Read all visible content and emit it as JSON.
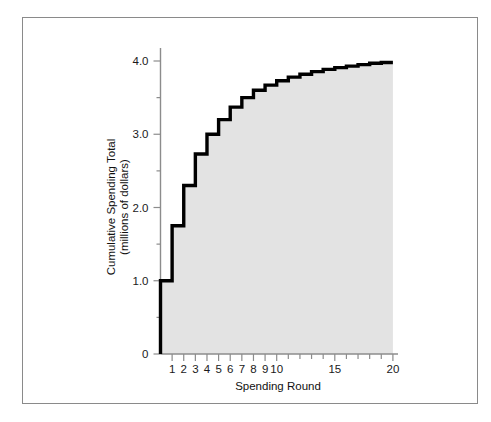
{
  "figure": {
    "background_color": "#ffffff",
    "frame_color": "#8a8a8a",
    "fill_color": "#e3e3e3",
    "line_color": "#000000"
  },
  "chart_data": {
    "type": "area",
    "title": "",
    "subtitle": "",
    "xlabel": "Spending Round",
    "ylabel": "Cumulative Spending Total\n(millions of dollars)",
    "ylabel_line1": "Cumulative Spending Total",
    "ylabel_line2": "(millions of dollars)",
    "x": [
      1,
      2,
      3,
      4,
      5,
      6,
      7,
      8,
      9,
      10,
      11,
      12,
      13,
      14,
      15,
      16,
      17,
      18,
      19,
      20
    ],
    "values": [
      1.0,
      1.75,
      2.3,
      2.73,
      3.0,
      3.2,
      3.37,
      3.5,
      3.6,
      3.67,
      3.73,
      3.78,
      3.82,
      3.855,
      3.885,
      3.91,
      3.93,
      3.95,
      3.97,
      3.98
    ],
    "series": [
      {
        "name": "Cumulative Spending Total",
        "values": [
          1.0,
          1.75,
          2.3,
          2.73,
          3.0,
          3.2,
          3.37,
          3.5,
          3.6,
          3.67,
          3.73,
          3.78,
          3.82,
          3.855,
          3.885,
          3.91,
          3.93,
          3.95,
          3.97,
          3.98
        ]
      }
    ],
    "xlim": [
      0,
      20.5
    ],
    "ylim": [
      0,
      4.25
    ],
    "grid": false,
    "legend": "none",
    "x_tick_positions": [
      1,
      2,
      3,
      4,
      5,
      6,
      7,
      8,
      9,
      10,
      11,
      12,
      13,
      14,
      15,
      16,
      17,
      18,
      19,
      20
    ],
    "x_tick_labels": [
      "1",
      "2",
      "3",
      "4",
      "5",
      "6",
      "7",
      "8",
      "9",
      "10",
      "",
      "",
      "",
      "",
      "15",
      "",
      "",
      "",
      "",
      "20"
    ],
    "x_labeled_ticks": [
      {
        "value": 1,
        "label": "1"
      },
      {
        "value": 2,
        "label": "2"
      },
      {
        "value": 3,
        "label": "3"
      },
      {
        "value": 4,
        "label": "4"
      },
      {
        "value": 5,
        "label": "5"
      },
      {
        "value": 6,
        "label": "6"
      },
      {
        "value": 7,
        "label": "7"
      },
      {
        "value": 8,
        "label": "8"
      },
      {
        "value": 9,
        "label": "9"
      },
      {
        "value": 10,
        "label": "10"
      },
      {
        "value": 15,
        "label": "15"
      },
      {
        "value": 20,
        "label": "20"
      }
    ],
    "y_tick_positions": [
      0,
      0.5,
      1.0,
      1.5,
      2.0,
      2.5,
      3.0,
      3.5,
      4.0
    ],
    "y_labeled_ticks": [
      {
        "value": 0,
        "label": "0"
      },
      {
        "value": 1.0,
        "label": "1.0"
      },
      {
        "value": 2.0,
        "label": "2.0"
      },
      {
        "value": 3.0,
        "label": "3.0"
      },
      {
        "value": 4.0,
        "label": "4.0"
      }
    ]
  }
}
